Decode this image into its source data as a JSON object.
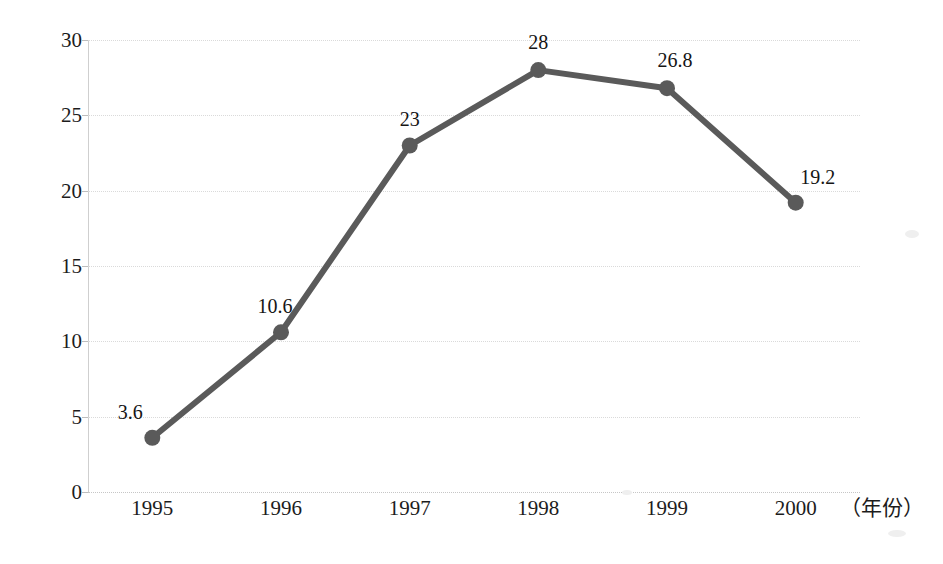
{
  "chart_data": {
    "type": "line",
    "title": "",
    "xlabel": "（年份）",
    "ylabel": "",
    "categories": [
      "1995",
      "1996",
      "1997",
      "1998",
      "1999",
      "2000"
    ],
    "values": [
      3.6,
      10.6,
      23,
      28,
      26.8,
      19.2
    ],
    "point_labels": [
      "3.6",
      "10.6",
      "23",
      "28",
      "26.8",
      "19.2"
    ],
    "series": [
      {
        "name": "",
        "values": [
          3.6,
          10.6,
          23,
          28,
          26.8,
          19.2
        ]
      }
    ],
    "ylim": [
      0,
      30
    ],
    "yticks": [
      0,
      5,
      10,
      15,
      20,
      25,
      30
    ],
    "ytick_labels": [
      "0",
      "5",
      "10",
      "15",
      "20",
      "25",
      "30"
    ],
    "grid": true,
    "grid_axis": "y",
    "legend": false,
    "legend_position": "none",
    "marker": "circle",
    "colors": {
      "line": "#5a5a5a",
      "marker": "#5a5a5a",
      "grid": "#dadada",
      "axis": "#cfcfcf",
      "text": "#1c1c1c",
      "background": "#ffffff"
    }
  },
  "axis": {
    "x_caption": "（年份）"
  }
}
